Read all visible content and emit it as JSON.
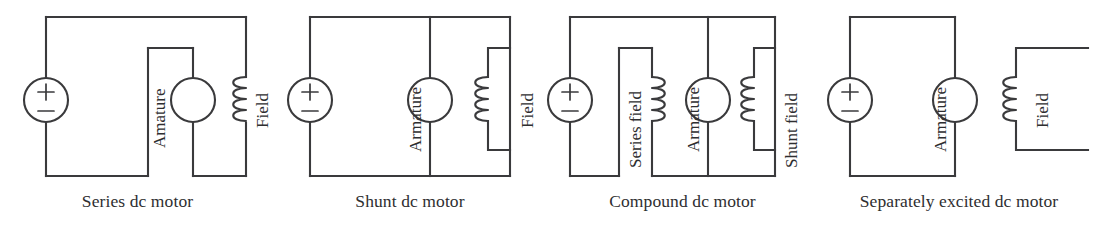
{
  "figure": {
    "line_color": "#3a3a3c",
    "text_color": "#2e2e30",
    "background_color": "#ffffff"
  },
  "circuits": [
    {
      "id": "series-dc-motor",
      "caption": "Series dc motor",
      "source": {
        "plus": "+",
        "minus": "−"
      },
      "components": [
        {
          "name": "armature",
          "label": "Amature",
          "type": "armature"
        },
        {
          "name": "field",
          "label": "Field",
          "type": "inductor",
          "coil_side": "left"
        }
      ]
    },
    {
      "id": "shunt-dc-motor",
      "caption": "Shunt dc motor",
      "source": {
        "plus": "+",
        "minus": "−"
      },
      "components": [
        {
          "name": "armature",
          "label": "Armature",
          "type": "armature"
        },
        {
          "name": "field",
          "label": "Field",
          "type": "inductor",
          "coil_side": "left"
        }
      ]
    },
    {
      "id": "compound-dc-motor",
      "caption": "Compound dc motor",
      "source": {
        "plus": "+",
        "minus": "−"
      },
      "components": [
        {
          "name": "series-field",
          "label": "Series field",
          "type": "inductor",
          "coil_side": "right"
        },
        {
          "name": "armature",
          "label": "Armature",
          "type": "armature"
        },
        {
          "name": "shunt-field",
          "label": "Shunt field",
          "type": "inductor",
          "coil_side": "left"
        }
      ]
    },
    {
      "id": "separately-excited-dc-motor",
      "caption": "Separately excited dc motor",
      "source": {
        "plus": "+",
        "minus": "−"
      },
      "components": [
        {
          "name": "armature",
          "label": "Armature",
          "type": "armature"
        },
        {
          "name": "field",
          "label": "Field",
          "type": "inductor",
          "coil_side": "left"
        }
      ]
    }
  ]
}
